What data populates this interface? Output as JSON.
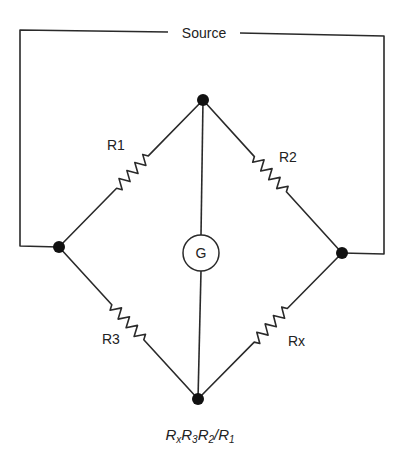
{
  "source_label": "Source",
  "galvanometer_label": "G",
  "resistors": [
    {
      "id": "R1",
      "label": "R1",
      "arm": "left-top"
    },
    {
      "id": "R2",
      "label": "R2",
      "arm": "top-right"
    },
    {
      "id": "R3",
      "label": "R3",
      "arm": "left-bottom"
    },
    {
      "id": "Rx",
      "label": "Rx",
      "arm": "bottom-right"
    }
  ],
  "nodes": [
    "top",
    "left",
    "right",
    "bottom"
  ],
  "formula": {
    "parts": [
      {
        "main": "R",
        "sub": "x"
      },
      {
        "main": "R",
        "sub": "3"
      },
      {
        "main": "R",
        "sub": "2"
      },
      {
        "main": "/R",
        "sub": "1"
      }
    ],
    "text": "RxR3R2/R1"
  }
}
